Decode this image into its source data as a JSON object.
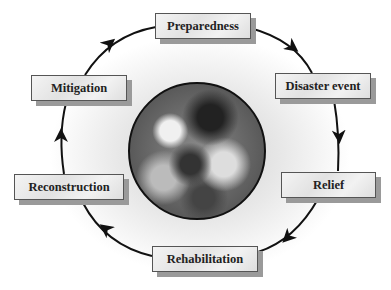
{
  "diagram": {
    "type": "cycle",
    "center_image": "earth-globe",
    "stages": [
      {
        "label": "Preparedness"
      },
      {
        "label": "Disaster event"
      },
      {
        "label": "Relief"
      },
      {
        "label": "Rehabilitation"
      },
      {
        "label": "Reconstruction"
      },
      {
        "label": "Mitigation"
      }
    ],
    "direction": "clockwise",
    "colors": {
      "box_border": "#555555",
      "shadow": "#9a9a9a",
      "arrow": "#111111"
    }
  }
}
